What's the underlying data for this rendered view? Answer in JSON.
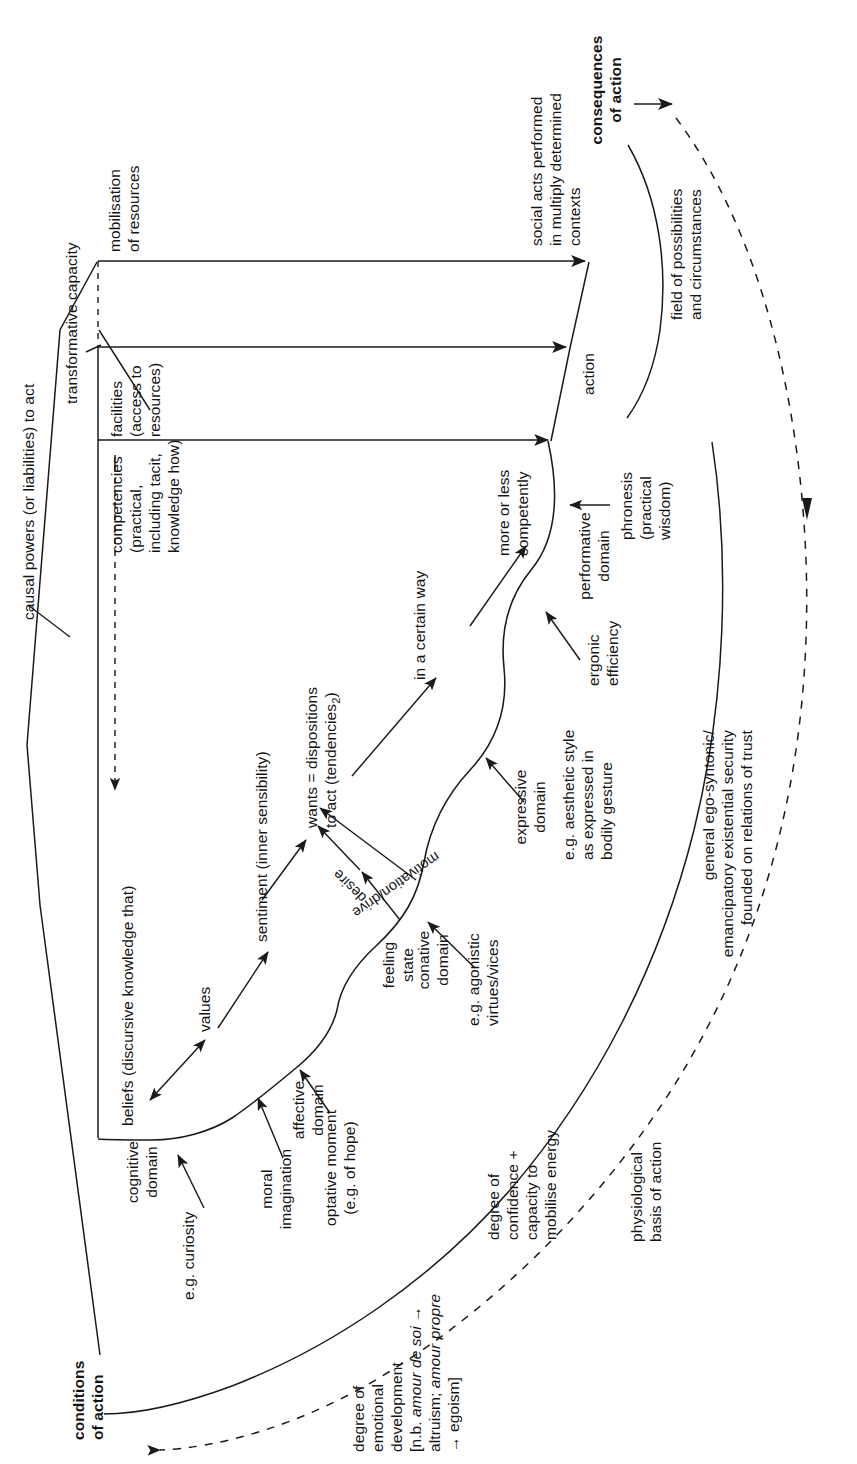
{
  "figure": {
    "orientation": "rotated-90-ccw",
    "line_color": "#1a1a1a",
    "background": "#ffffff"
  },
  "headings": {
    "conditions_of_action": "conditions\nof action",
    "consequences_of_action": "consequences\nof action"
  },
  "brackets": {
    "causal_powers": "causal powers (or liabilities) to act",
    "transformative_capacity": "transformative capacity",
    "field_of_possibilities": "field of possibilities\nand circumstances"
  },
  "capacity_channels": [
    {
      "id": "mobilisation",
      "label": "mobilisation\nof resources",
      "target": "social acts"
    },
    {
      "id": "facilities",
      "label": "facilities\n(access to\nresources)",
      "target": "action"
    },
    {
      "id": "competencies",
      "label": "competencies\n(practical,\nincluding tacit,\nknowledge how)",
      "target": "more or less competently"
    }
  ],
  "outputs": {
    "social_acts": "social acts performed\nin multiply determined\ncontexts",
    "action": "action",
    "more_or_less_competently": "more or less\ncompetently",
    "in_a_certain_way": "in a certain way"
  },
  "mental_chain": {
    "beliefs": "beliefs (discursive knowledge that)",
    "values": "values",
    "sentiment": "sentiment (inner sensibility)",
    "wants_line1": "wants = dispositions",
    "wants_line2_pre": "to act (tendencies",
    "wants_sub": "2",
    "wants_line2_post": ")",
    "desire": "desire",
    "motivation_drive": "motivation/drive",
    "feeling_state": "feeling\nstate"
  },
  "domains": [
    {
      "id": "cognitive",
      "label": "cognitive\ndomain",
      "example_label": "e.g. curiosity"
    },
    {
      "id": "affective",
      "label": "affective\ndomain",
      "example_label": "optative moment\n(e.g. of hope)"
    },
    {
      "id": "conative",
      "label": "conative\ndomain",
      "example_label": "e.g. agonistic\nvirtues/vices"
    },
    {
      "id": "expressive",
      "label": "expressive\ndomain",
      "example_label": "e.g. aesthetic style\nas expressed in\nbodily gesture"
    },
    {
      "id": "performative",
      "label": "performative\ndomain",
      "example_label": "phronesis\n(practical\nwisdom)"
    }
  ],
  "annotations": {
    "moral_imagination": "moral\nimagination",
    "ergonic_efficiency": "ergonic\nefficiency",
    "degree_of_emotional_development_l1": "degree of",
    "degree_of_emotional_development_l2": "emotional",
    "degree_of_emotional_development_l3": "development",
    "degree_of_emotional_development_l4_pre": "[n.b. ",
    "degree_of_emotional_development_l4_ital": "amour de soi",
    "degree_of_emotional_development_l4_post": " →",
    "degree_of_emotional_development_l5_pre": "altruism; ",
    "degree_of_emotional_development_l5_ital": "amour propre",
    "degree_of_emotional_development_l6": "→ egoism]",
    "degree_of_confidence": "degree of\nconfidence +\ncapacity to\nmobilise energy",
    "physiological_basis": "physiological\nbasis of action",
    "general_ego_syntonic": "general ego-syntonic/\nemancipatory existential security\nfounded on relations of trust"
  },
  "icons": {
    "arrow_head": "arrowhead-icon",
    "dashed_feedback": "dashed-feedback-arrow-icon",
    "double_arrow": "double-headed-arrow-icon"
  }
}
